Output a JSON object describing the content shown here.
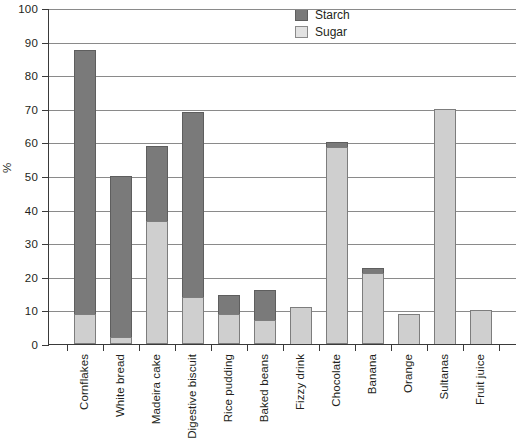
{
  "chart_data": {
    "type": "bar",
    "title": "",
    "subtitle": "",
    "xlabel": "",
    "ylabel": "%",
    "ylim": [
      0,
      100
    ],
    "ytick_step": 10,
    "yticks": [
      100,
      90,
      80,
      70,
      60,
      50,
      40,
      30,
      20,
      10,
      0
    ],
    "grid": true,
    "stacked": true,
    "legend_position": "top-right",
    "categories": [
      "Cornflakes",
      "White bread",
      "Madeira cake",
      "Digestive biscuit",
      "Rice pudding",
      "Baked beans",
      "Fizzy drink",
      "Chocolate",
      "Banana",
      "Orange",
      "Sultanas",
      "Fruit juice"
    ],
    "series": [
      {
        "name": "Sugar",
        "color": "#cfcfcf",
        "values": [
          9,
          2,
          36.5,
          14,
          9,
          7,
          11,
          58.5,
          21,
          9,
          70,
          10
        ]
      },
      {
        "name": "Starch",
        "color": "#7a7a7a",
        "values": [
          78.5,
          48,
          22.5,
          55,
          5.5,
          9,
          0,
          1.5,
          1.5,
          0,
          0,
          0
        ]
      }
    ],
    "totals": [
      87.5,
      50,
      59,
      69,
      14.5,
      16,
      11,
      60,
      22.5,
      9,
      70,
      10
    ]
  },
  "legend": {
    "items": [
      {
        "label": "Starch",
        "swatch": "starch"
      },
      {
        "label": "Sugar",
        "swatch": "sugar"
      }
    ]
  },
  "axis": {
    "y_title": "%"
  }
}
